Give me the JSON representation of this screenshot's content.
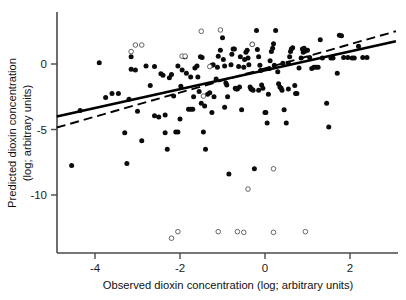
{
  "chart_data": {
    "type": "scatter",
    "title": "",
    "xlabel": "Observed dioxin concentration (log; arbitrary units)",
    "ylabel_line1": "Predicted dioxin concentration",
    "ylabel_line2": "(log; arbitrary units)",
    "xlim": [
      -4.9,
      3.1
    ],
    "ylim": [
      -14.5,
      2.9
    ],
    "grid": false,
    "legend": "none",
    "xticks": [
      -4,
      -2,
      0,
      2
    ],
    "xtick_labels": [
      "-4",
      "-2",
      "0",
      "2"
    ],
    "yticks": [
      0,
      -5,
      -10
    ],
    "ytick_labels": [
      "0",
      "-5",
      "-10"
    ],
    "series": [
      {
        "name": "filled-points",
        "marker": "filled-circle",
        "color": "#0b0b0b",
        "points": [
          [
            -4.55,
            -7.75
          ],
          [
            -4.35,
            -3.55
          ],
          [
            -3.9,
            0.1
          ],
          [
            -3.75,
            -2.55
          ],
          [
            -3.6,
            -2.25
          ],
          [
            -3.45,
            -2.25
          ],
          [
            -3.3,
            -5.25
          ],
          [
            -3.25,
            -7.6
          ],
          [
            -3.2,
            -2.7
          ],
          [
            -3.15,
            0.55
          ],
          [
            -3.15,
            -0.4
          ],
          [
            -3.05,
            -0.45
          ],
          [
            -3.0,
            -3.6
          ],
          [
            -2.9,
            -5.85
          ],
          [
            -2.8,
            -0.15
          ],
          [
            -2.7,
            -1.65
          ],
          [
            -2.6,
            -3.95
          ],
          [
            -2.5,
            -4.05
          ],
          [
            -2.45,
            -0.75
          ],
          [
            -2.4,
            -0.85
          ],
          [
            -2.35,
            -5.25
          ],
          [
            -2.3,
            -6.5
          ],
          [
            -2.25,
            -1.05
          ],
          [
            -2.2,
            -0.8
          ],
          [
            -2.15,
            -2.45
          ],
          [
            -2.1,
            -5.2
          ],
          [
            -2.05,
            -5.2
          ],
          [
            -2.0,
            -4.2
          ],
          [
            -1.95,
            -0.45
          ],
          [
            -1.9,
            0.55
          ],
          [
            -1.88,
            0.55
          ],
          [
            -1.85,
            -0.7
          ],
          [
            -1.8,
            -3.45
          ],
          [
            -1.75,
            -3.45
          ],
          [
            -1.7,
            -3.45
          ],
          [
            -1.68,
            -2.5
          ],
          [
            -1.65,
            -0.3
          ],
          [
            -1.6,
            -0.15
          ],
          [
            -1.58,
            -1.0
          ],
          [
            -1.55,
            -2.1
          ],
          [
            -1.5,
            -3.0
          ],
          [
            -1.45,
            -5.2
          ],
          [
            -1.42,
            -3.2
          ],
          [
            -1.4,
            -6.5
          ],
          [
            -1.35,
            -2.3
          ],
          [
            -1.3,
            -2.2
          ],
          [
            -1.25,
            -3.7
          ],
          [
            -1.2,
            -2.5
          ],
          [
            -1.15,
            -1.15
          ],
          [
            -1.12,
            -0.25
          ],
          [
            -1.1,
            0.6
          ],
          [
            -1.05,
            1.05
          ],
          [
            -1.0,
            2.0
          ],
          [
            -0.98,
            0.35
          ],
          [
            -0.95,
            -0.15
          ],
          [
            -0.92,
            -1.45
          ],
          [
            -0.9,
            -1.6
          ],
          [
            -0.88,
            -2.5
          ],
          [
            -0.85,
            -8.4
          ],
          [
            -0.8,
            -0.05
          ],
          [
            -0.78,
            0.75
          ],
          [
            -0.75,
            1.15
          ],
          [
            -0.72,
            1.15
          ],
          [
            -0.7,
            -1.85
          ],
          [
            -0.68,
            -1.9
          ],
          [
            -0.65,
            -1.9
          ],
          [
            -0.6,
            -1.75
          ],
          [
            -0.55,
            -3.5
          ],
          [
            -0.5,
            -0.25
          ],
          [
            -0.48,
            0.35
          ],
          [
            -0.45,
            0.9
          ],
          [
            -0.42,
            1.05
          ],
          [
            -0.4,
            0.45
          ],
          [
            -0.38,
            -0.05
          ],
          [
            -0.35,
            -1.75
          ],
          [
            -0.33,
            -1.9
          ],
          [
            -0.3,
            -1.95
          ],
          [
            -0.28,
            -2.0
          ],
          [
            -0.25,
            -8.0
          ],
          [
            -0.2,
            2.55
          ],
          [
            -0.18,
            1.1
          ],
          [
            -0.15,
            0.55
          ],
          [
            -0.12,
            -0.1
          ],
          [
            -0.1,
            -0.5
          ],
          [
            -0.08,
            -1.6
          ],
          [
            -0.05,
            -1.85
          ],
          [
            0.0,
            -3.7
          ],
          [
            0.02,
            -3.7
          ],
          [
            0.05,
            -4.5
          ],
          [
            0.1,
            -0.35
          ],
          [
            0.12,
            0.25
          ],
          [
            0.15,
            0.95
          ],
          [
            0.18,
            1.2
          ],
          [
            0.2,
            1.55
          ],
          [
            0.25,
            2.55
          ],
          [
            0.3,
            -0.6
          ],
          [
            0.32,
            -1.5
          ],
          [
            0.35,
            -1.75
          ],
          [
            0.38,
            -1.85
          ],
          [
            0.4,
            -2.0
          ],
          [
            0.45,
            -3.5
          ],
          [
            0.5,
            -4.5
          ],
          [
            0.55,
            0.05
          ],
          [
            0.58,
            0.55
          ],
          [
            0.6,
            0.95
          ],
          [
            0.62,
            1.15
          ],
          [
            0.65,
            1.25
          ],
          [
            0.7,
            -1.65
          ],
          [
            0.72,
            -2.25
          ],
          [
            0.75,
            -2.25
          ],
          [
            0.8,
            -0.3
          ],
          [
            0.85,
            0.45
          ],
          [
            0.9,
            0.9
          ],
          [
            0.95,
            1.0
          ],
          [
            1.0,
            1.05
          ],
          [
            1.05,
            0.5
          ],
          [
            1.1,
            -0.35
          ],
          [
            1.15,
            -0.25
          ],
          [
            1.2,
            -0.25
          ],
          [
            1.25,
            -0.25
          ],
          [
            1.3,
            1.85
          ],
          [
            1.45,
            -3.0
          ],
          [
            1.5,
            -4.8
          ],
          [
            1.55,
            0.45
          ],
          [
            1.6,
            0.45
          ],
          [
            1.7,
            -0.7
          ],
          [
            1.75,
            2.2
          ],
          [
            1.8,
            2.15
          ],
          [
            1.85,
            0.5
          ],
          [
            1.95,
            0.5
          ],
          [
            2.05,
            0.45
          ],
          [
            2.1,
            0.45
          ],
          [
            2.2,
            1.35
          ],
          [
            2.3,
            0.5
          ],
          [
            2.4,
            0.5
          ],
          [
            -2.05,
            -0.15
          ],
          [
            -1.98,
            -1.7
          ],
          [
            -1.25,
            -0.1
          ],
          [
            -1.22,
            -0.05
          ],
          [
            -0.62,
            -0.2
          ],
          [
            -0.58,
            0.55
          ],
          [
            0.08,
            -2.3
          ],
          [
            0.22,
            -0.1
          ],
          [
            0.42,
            0.05
          ],
          [
            -1.52,
            0.55
          ],
          [
            -1.48,
            0.5
          ],
          [
            -0.3,
            1.5
          ],
          [
            0.88,
            1.15
          ],
          [
            0.92,
            1.2
          ],
          [
            -2.6,
            -0.2
          ],
          [
            -1.75,
            -1.0
          ],
          [
            -0.95,
            -3.3
          ],
          [
            -0.15,
            -2.0
          ],
          [
            0.55,
            -1.9
          ],
          [
            1.35,
            0.45
          ],
          [
            -2.35,
            -3.9
          ]
        ]
      },
      {
        "name": "open-points",
        "marker": "open-circle",
        "color": "#555555",
        "points": [
          [
            -3.15,
            0.95
          ],
          [
            -3.05,
            1.45
          ],
          [
            -2.9,
            1.45
          ],
          [
            -1.95,
            0.6
          ],
          [
            -1.88,
            0.6
          ],
          [
            -1.5,
            2.5
          ],
          [
            -1.05,
            2.6
          ],
          [
            -1.45,
            -2.45
          ],
          [
            -1.3,
            -0.2
          ],
          [
            -0.3,
            1.5
          ],
          [
            -0.4,
            -9.55
          ],
          [
            0.2,
            -8.0
          ],
          [
            -2.05,
            -12.8
          ],
          [
            -2.2,
            -13.3
          ],
          [
            -1.1,
            -12.8
          ],
          [
            -0.65,
            -12.8
          ],
          [
            -0.5,
            -12.85
          ],
          [
            0.2,
            -12.85
          ],
          [
            0.95,
            -12.8
          ]
        ]
      }
    ],
    "fit_lines": [
      {
        "name": "solid-regression-line",
        "style": "solid",
        "color": "#000000",
        "x0": -4.9,
        "y0": -4.0,
        "x1": 3.08,
        "y1": 1.73
      },
      {
        "name": "dashed-reference-line",
        "style": "dashed",
        "color": "#000000",
        "x0": -4.9,
        "y0": -4.85,
        "x1": 3.08,
        "y1": 2.5
      }
    ]
  },
  "figure": {
    "background_color": "#ffffff",
    "axis_color": "#4a4a4a"
  }
}
